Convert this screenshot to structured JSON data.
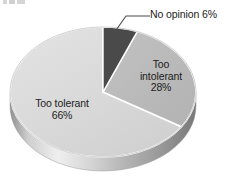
{
  "chart_data": {
    "type": "pie",
    "title": "",
    "subtitle": "",
    "xlabel": "",
    "ylabel": "",
    "legend_position": "none",
    "grid": false,
    "three_d": true,
    "background_color": "#ffffff",
    "categories": [
      "Too tolerant",
      "Too intolerant",
      "No opinion"
    ],
    "values": [
      66,
      28,
      6
    ],
    "unit": "%",
    "slices": [
      {
        "label": "Too tolerant",
        "value": 66,
        "value_text": "66%",
        "color": "#d8d8d8",
        "side_color": "#c2c2c2",
        "label_position": "inside",
        "label_lines": [
          "Too tolerant",
          "66%"
        ]
      },
      {
        "label": "Too intolerant",
        "value": 28,
        "value_text": "28%",
        "color": "#b9b9b9",
        "side_color": "#a3a3a3",
        "label_position": "inside",
        "label_lines": [
          "Too",
          "intolerant",
          "28%"
        ]
      },
      {
        "label": "No opinion",
        "value": 6,
        "value_text": "6%",
        "color": "#4a4a4a",
        "side_color": "#3a3a3a",
        "label_position": "outside-callout",
        "label_lines": [
          "No opinion  6%"
        ]
      }
    ]
  },
  "labels": {
    "too_tolerant_name": "Too tolerant",
    "too_tolerant_pct": "66%",
    "too_intolerant_line1": "Too",
    "too_intolerant_line2": "intolerant",
    "too_intolerant_pct": "28%",
    "no_opinion_text": "No opinion  6%"
  },
  "colors": {
    "slice_too_tolerant": "#d8d8d8",
    "slice_too_intolerant": "#b9b9b9",
    "slice_no_opinion": "#4a4a4a",
    "separator": "#ffffff",
    "text": "#1c1c1c",
    "leader_line": "#4a4a4a",
    "background": "#ffffff"
  }
}
